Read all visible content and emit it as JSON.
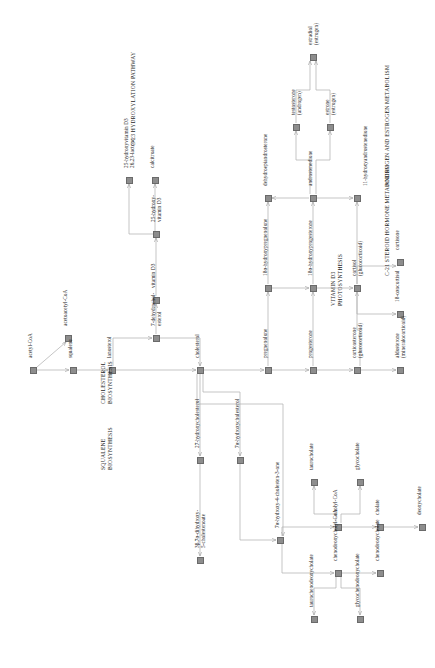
{
  "diagram": {
    "orientation": "rotated-90-ccw",
    "node_color": "#8d8d8d",
    "line_color": "#b6b6b6",
    "text_color": "#262626",
    "background": "#ffffff"
  },
  "sections": [
    {
      "id": "squalene",
      "lines": [
        "SQUALENE",
        "BIOSYNTHESIS"
      ],
      "x": 100,
      "y": 470
    },
    {
      "id": "cholesterol",
      "lines": [
        "CHOLESTEROL",
        "BIOSYNTHESIS"
      ],
      "x": 100,
      "y": 404
    },
    {
      "id": "vitd",
      "lines": [
        "VITAMIN D3",
        "PHOTOSYNTHESIS"
      ],
      "x": 330,
      "y": 306
    },
    {
      "id": "c23",
      "lines": [
        "C-23 HYDROXYLATION PATHWAY"
      ],
      "x": 130,
      "y": 146
    },
    {
      "id": "c21",
      "lines": [
        "C-21 STEROID HORMONE METABOLISM"
      ],
      "x": 384,
      "y": 276
    },
    {
      "id": "androgen",
      "lines": [
        "ANDROGEN AND ESTROGEN METABOLISM"
      ],
      "x": 384,
      "y": 186
    },
    {
      "id": "bile",
      "lines": [
        "BILE ACID BIOSYNTHESIS",
        "AND UTILISATION"
      ],
      "x": 640,
      "y": 270
    }
  ],
  "nodes": [
    {
      "id": "acetyl-coa",
      "label": "acetyl-CoA",
      "x": 33,
      "y": 370,
      "lx": 27,
      "ly": 358,
      "lines": 1
    },
    {
      "id": "acetoacetyl-coa",
      "label": "acetoacetyl-CoA",
      "x": 68,
      "y": 338,
      "lx": 62,
      "ly": 326,
      "lines": 1
    },
    {
      "id": "squalene",
      "label": "squalene",
      "x": 73,
      "y": 370,
      "lx": 67,
      "ly": 358,
      "lines": 1
    },
    {
      "id": "lanosterol",
      "label": "lanosterol",
      "x": 112,
      "y": 370,
      "lx": 106,
      "ly": 358,
      "lines": 1
    },
    {
      "id": "7-dehydrocholesterol",
      "label": "7-dehydrochol-\nesterol",
      "x": 156,
      "y": 338,
      "lx": 150,
      "ly": 326,
      "lines": 2
    },
    {
      "id": "vitamin-d3",
      "label": "vitamin D3",
      "x": 156,
      "y": 300,
      "lx": 150,
      "ly": 288,
      "lines": 1
    },
    {
      "id": "25-hydroxy-vitamin-d3",
      "label": "25-hydroxy-\nvitamin D3",
      "x": 156,
      "y": 234,
      "lx": 150,
      "ly": 222,
      "lines": 2
    },
    {
      "id": "25-hydroxyvitamin-d3-26-23-lactone",
      "label": "25-hydroxyvitamin D3\n26,23-lactone",
      "x": 129,
      "y": 180,
      "lx": 123,
      "ly": 168,
      "lines": 2
    },
    {
      "id": "calcitroate",
      "label": "calcitroate",
      "x": 155,
      "y": 180,
      "lx": 149,
      "ly": 168,
      "lines": 1
    },
    {
      "id": "cholesterol",
      "label": "cholesterol",
      "x": 200,
      "y": 370,
      "lx": 194,
      "ly": 358,
      "lines": 1
    },
    {
      "id": "27-hydroxycholesterol",
      "label": "27-hydroxycholesterol",
      "x": 200,
      "y": 460,
      "lx": 194,
      "ly": 448,
      "lines": 1
    },
    {
      "id": "3b-7a-dihydroxy-5-cholestenoate",
      "label": "3β,7α-dihydroxy-\n5-cholestenoate",
      "x": 200,
      "y": 560,
      "lx": 194,
      "ly": 548,
      "lines": 2
    },
    {
      "id": "7a-hydroxycholesterol",
      "label": "7α-hydroxycholesterol",
      "x": 240,
      "y": 460,
      "lx": 234,
      "ly": 448,
      "lines": 1
    },
    {
      "id": "7a-hydroxy-4-cholesten-3-one",
      "label": "7α-hydroxy-4-cholesten-3-one",
      "x": 280,
      "y": 540,
      "lx": 274,
      "ly": 528,
      "lines": 1
    },
    {
      "id": "cholyl-coa",
      "label": "cholyl-CoA",
      "x": 338,
      "y": 527,
      "lx": 332,
      "ly": 515,
      "lines": 1
    },
    {
      "id": "taurocholate",
      "label": "taurocholate",
      "x": 314,
      "y": 482,
      "lx": 308,
      "ly": 470,
      "lines": 1
    },
    {
      "id": "glycocholate",
      "label": "glycocholate",
      "x": 360,
      "y": 482,
      "lx": 354,
      "ly": 470,
      "lines": 1
    },
    {
      "id": "cholate",
      "label": "cholate",
      "x": 380,
      "y": 527,
      "lx": 374,
      "ly": 515,
      "lines": 1
    },
    {
      "id": "deoxycholate",
      "label": "deoxycholate",
      "x": 422,
      "y": 527,
      "lx": 416,
      "ly": 515,
      "lines": 1
    },
    {
      "id": "chenodeoxycholyl-coa",
      "label": "chenodeoxycholyl-CoA",
      "x": 338,
      "y": 573,
      "lx": 332,
      "ly": 561,
      "lines": 1
    },
    {
      "id": "taurochenodeoxycholate",
      "label": "taurochenodeoxycholate",
      "x": 314,
      "y": 619,
      "lx": 308,
      "ly": 607,
      "lines": 1
    },
    {
      "id": "glycochenodeoxycholate",
      "label": "glycochenodeoxycholate",
      "x": 360,
      "y": 619,
      "lx": 354,
      "ly": 607,
      "lines": 1
    },
    {
      "id": "chenodeoxycholate",
      "label": "chenodeoxycholate",
      "x": 380,
      "y": 573,
      "lx": 374,
      "ly": 561,
      "lines": 1
    },
    {
      "id": "pregnenolone",
      "label": "pregnenolone",
      "x": 268,
      "y": 370,
      "lx": 262,
      "ly": 358,
      "lines": 1
    },
    {
      "id": "progesterone",
      "label": "progesterone",
      "x": 313,
      "y": 370,
      "lx": 307,
      "ly": 358,
      "lines": 1
    },
    {
      "id": "corticosterone",
      "label": "corticosterone\n(glucocorticoid)",
      "x": 357,
      "y": 370,
      "lx": 351,
      "ly": 358,
      "lines": 2
    },
    {
      "id": "aldosterone",
      "label": "aldosterone\n(mineralocorticoid)",
      "x": 400,
      "y": 370,
      "lx": 394,
      "ly": 358,
      "lines": 2
    },
    {
      "id": "18a-hydroxypregnenolone",
      "label": "18α-hydroxypregnenolone",
      "x": 268,
      "y": 288,
      "lx": 262,
      "ly": 276,
      "lines": 1
    },
    {
      "id": "18a-hydroxyprogesterone",
      "label": "18α-hydroxyprogesterone",
      "x": 313,
      "y": 288,
      "lx": 307,
      "ly": 276,
      "lines": 1
    },
    {
      "id": "cortisol",
      "label": "cortisol\n(glucocorticoid)",
      "x": 357,
      "y": 288,
      "lx": 351,
      "ly": 276,
      "lines": 2
    },
    {
      "id": "cortisone",
      "label": "cortisone",
      "x": 400,
      "y": 262,
      "lx": 394,
      "ly": 250,
      "lines": 1
    },
    {
      "id": "18-oxocortisol",
      "label": "18-oxocortisol",
      "x": 400,
      "y": 314,
      "lx": 394,
      "ly": 302,
      "lines": 1
    },
    {
      "id": "dehydroepiandrosterone",
      "label": "dehydroepiandrosterone",
      "x": 268,
      "y": 198,
      "lx": 262,
      "ly": 186,
      "lines": 1
    },
    {
      "id": "androstenedione",
      "label": "androstenedione",
      "x": 313,
      "y": 198,
      "lx": 307,
      "ly": 186,
      "lines": 1
    },
    {
      "id": "11-hydroxyandrostenedione",
      "label": "11-hydroxyandrostenedione",
      "x": 357,
      "y": 198,
      "lx": 362,
      "ly": 186,
      "lines": 1
    },
    {
      "id": "testosterone",
      "label": "testosterone\n(androgen)",
      "x": 296,
      "y": 127,
      "lx": 290,
      "ly": 115,
      "lines": 2
    },
    {
      "id": "estrone",
      "label": "estrone\n(estrogen)",
      "x": 330,
      "y": 127,
      "lx": 324,
      "ly": 115,
      "lines": 2
    },
    {
      "id": "estradiol",
      "label": "estradiol\n(estrogen)",
      "x": 313,
      "y": 57,
      "lx": 307,
      "ly": 45,
      "lines": 2
    }
  ]
}
